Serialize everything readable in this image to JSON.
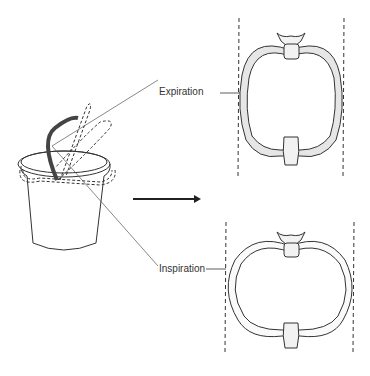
{
  "figure": {
    "labels": {
      "expiration": "Expiration",
      "inspiration": "Inspiration"
    },
    "colors": {
      "line": "#333333",
      "rib_fill": "#e4e4e4",
      "handle_dark": "#444444"
    }
  }
}
